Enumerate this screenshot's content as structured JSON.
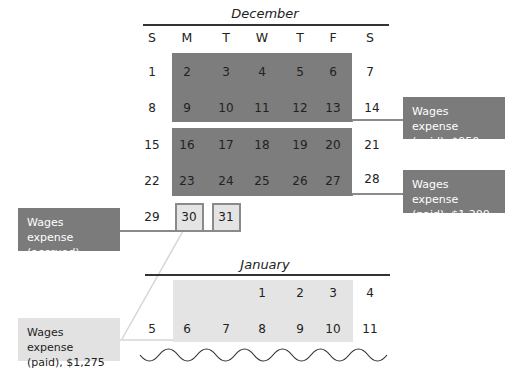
{
  "colors": {
    "paid_block": "#7d7d7d",
    "accrued_block": "#e4e4e4",
    "callout_dark": "#7b7b7b",
    "callout_light": "#e2e2e2",
    "connector_dark": "#8a8a8a",
    "connector_light": "#d0d0d0"
  },
  "december": {
    "title": "December",
    "days_of_week": [
      "S",
      "M",
      "T",
      "W",
      "T",
      "F",
      "S"
    ],
    "weeks": [
      [
        "1",
        "2",
        "3",
        "4",
        "5",
        "6",
        "7"
      ],
      [
        "8",
        "9",
        "10",
        "11",
        "12",
        "13",
        "14"
      ],
      [
        "15",
        "16",
        "17",
        "18",
        "19",
        "20",
        "21"
      ],
      [
        "22",
        "23",
        "24",
        "25",
        "26",
        "27",
        "28"
      ],
      [
        "29",
        "30",
        "31"
      ]
    ]
  },
  "january": {
    "title": "January",
    "weeks": [
      [
        "",
        "",
        "",
        "1",
        "2",
        "3",
        "4"
      ],
      [
        "5",
        "6",
        "7",
        "8",
        "9",
        "10",
        "11"
      ]
    ]
  },
  "callouts": {
    "paid_950": {
      "line1": "Wages expense",
      "line2": "(paid), $950"
    },
    "paid_1200": {
      "line1": "Wages expense",
      "line2": "(paid), $1,200"
    },
    "accrued_250": {
      "line1": "Wages expense",
      "line2": "(accrued), $250"
    },
    "paid_1275": {
      "line1": "Wages expense",
      "line2": "(paid), $1,275"
    }
  }
}
